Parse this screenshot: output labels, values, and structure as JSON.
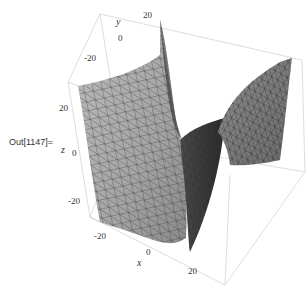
{
  "cell": {
    "output_label": "Out[1147]="
  },
  "plot3d": {
    "type": "surface3d",
    "axes": {
      "x": {
        "label": "x",
        "ticks": [
          "-20",
          "0",
          "20"
        ]
      },
      "y": {
        "label": "y",
        "ticks": [
          "-20",
          "0",
          "20"
        ]
      },
      "z": {
        "label": "z",
        "ticks": [
          "20",
          "0",
          "-20"
        ]
      }
    },
    "box_color": "#c8c8c8",
    "surface_color": "#a8a8a8",
    "mesh_color": "#333333"
  }
}
